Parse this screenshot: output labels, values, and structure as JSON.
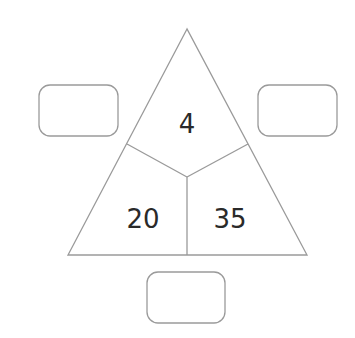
{
  "diagram": {
    "type": "multiplication-triangle",
    "top_value": "4",
    "bottom_left_value": "20",
    "bottom_right_value": "35",
    "answer_boxes": {
      "left": "",
      "right": "",
      "bottom": ""
    }
  },
  "colors": {
    "line": "#9a9a9a",
    "text": "#2a2a2a",
    "background": "#ffffff"
  }
}
